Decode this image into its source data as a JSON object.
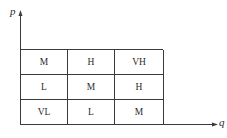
{
  "diagram": {
    "type": "risk-matrix",
    "axes": {
      "y_label": "p",
      "x_label": "q"
    },
    "grid": {
      "rows": [
        [
          "M",
          "H",
          "VH"
        ],
        [
          "L",
          "M",
          "H"
        ],
        [
          "VL",
          "L",
          "M"
        ]
      ]
    },
    "colors": {
      "line": "#3a3a3a",
      "text": "#2a2a2a",
      "background": "#ffffff"
    }
  }
}
